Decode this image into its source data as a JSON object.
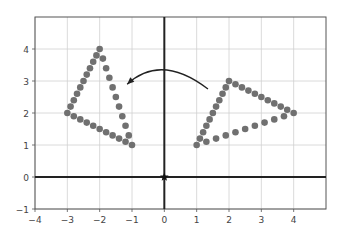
{
  "chart_data": {
    "type": "scatter",
    "title": "",
    "xlabel": "",
    "ylabel": "",
    "xlim": [
      -4,
      5
    ],
    "ylim": [
      -1,
      5
    ],
    "grid": true,
    "x_ticks": [
      -4,
      -3,
      -2,
      -1,
      0,
      1,
      2,
      3,
      4
    ],
    "y_ticks": [
      -1,
      0,
      1,
      2,
      3,
      4
    ],
    "x_tick_labels": [
      "−4",
      "−3",
      "−2",
      "−1",
      "0",
      "1",
      "2",
      "3",
      "4"
    ],
    "y_tick_labels": [
      "−1",
      "0",
      "1",
      "2",
      "3",
      "4"
    ],
    "point_color": "#707070",
    "axis_color": "#222222",
    "series": [
      {
        "name": "original-triangle",
        "vertices": [
          [
            -2,
            4
          ],
          [
            -3,
            2
          ],
          [
            -1,
            1
          ]
        ],
        "points_per_edge": 10
      },
      {
        "name": "rotated-triangle",
        "vertices": [
          [
            4,
            2
          ],
          [
            2,
            3
          ],
          [
            1,
            1
          ]
        ],
        "points_per_edge": 10
      }
    ],
    "origin_marker": {
      "x": 0,
      "y": 0,
      "symbol": "star"
    },
    "annotations": [
      {
        "type": "curved-arrow",
        "from": [
          1.35,
          2.75
        ],
        "via": [
          0,
          3.35
        ],
        "to": [
          -1.15,
          2.9
        ],
        "description": "rotation arrow from rotated triangle to original"
      }
    ]
  }
}
